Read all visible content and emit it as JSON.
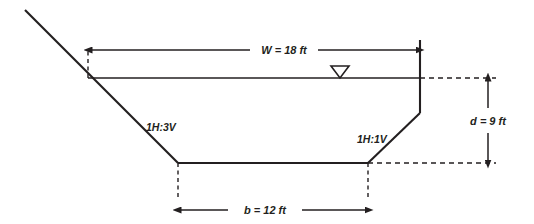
{
  "figure": {
    "background_color": "#ffffff",
    "line_color": "#231f20"
  },
  "dimensions": {
    "top_width": {
      "symbol": "W",
      "label": "W = 18 ft",
      "value": 18,
      "units": "ft"
    },
    "bottom_width": {
      "symbol": "b",
      "label": "b = 12 ft",
      "value": 12,
      "units": "ft"
    },
    "depth": {
      "symbol": "d",
      "label": "d = 9 ft",
      "value": 9,
      "units": "ft"
    }
  },
  "slopes": {
    "left": {
      "label": "1H:3V",
      "horizontal": 1,
      "vertical": 3
    },
    "right": {
      "label": "1H:1V",
      "horizontal": 1,
      "vertical": 1
    }
  },
  "symbols": {
    "water_surface": "water-surface-triangle"
  }
}
